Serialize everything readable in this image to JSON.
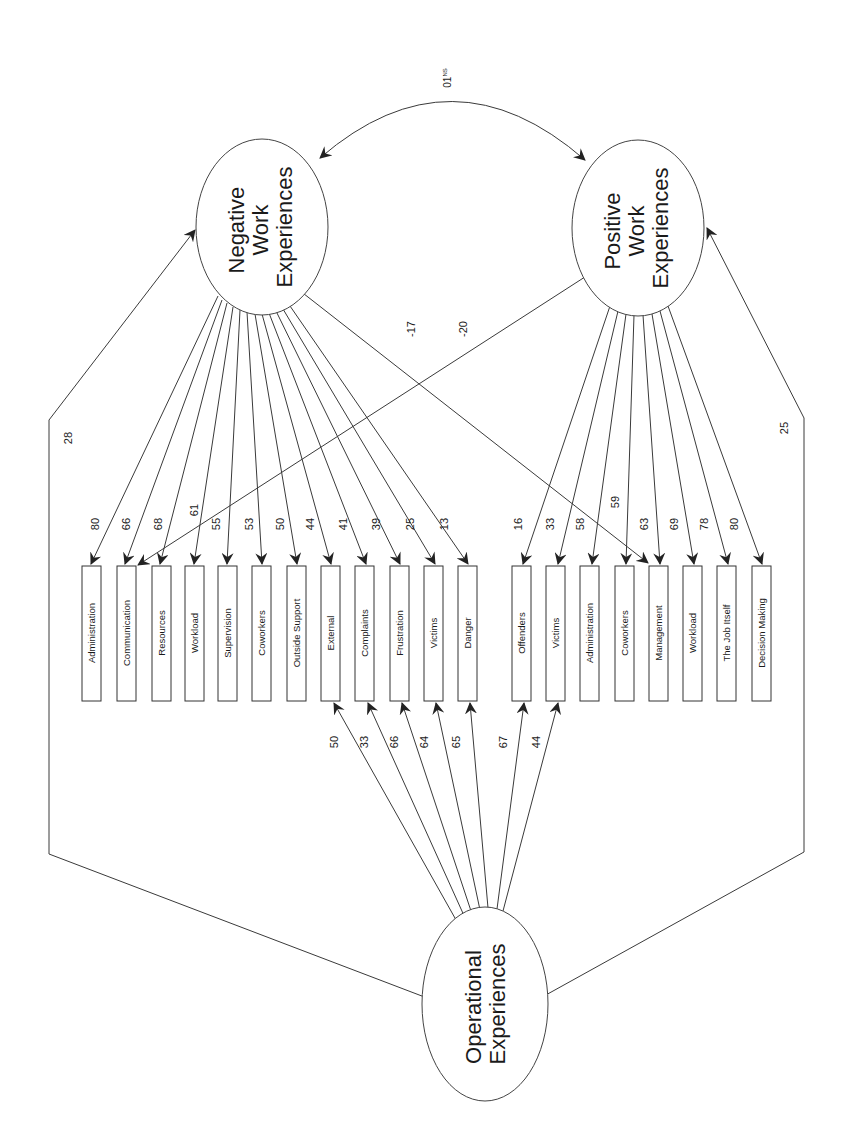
{
  "diagram": {
    "orientation": "rotated-90-ccw",
    "latent_factors": {
      "negative": {
        "label_lines": [
          "Negative",
          "Work",
          "Experiences"
        ],
        "cx": 262,
        "cy": 227,
        "rx": 66,
        "ry": 88
      },
      "positive": {
        "label_lines": [
          "Positive",
          "Work",
          "Experiences"
        ],
        "cx": 638,
        "cy": 228,
        "rx": 66,
        "ry": 88
      },
      "operational": {
        "label_lines": [
          "Operational",
          "Experiences"
        ],
        "cx": 485,
        "cy": 1004,
        "rx": 63,
        "ry": 97
      }
    },
    "correlation_negative_positive": {
      "label": "01",
      "superscript": "NS"
    },
    "path_operational_negative": {
      "label": "28"
    },
    "path_operational_positive": {
      "label": "25"
    },
    "negative_indicators": [
      {
        "label": "Administration",
        "loading": "80",
        "x": 88
      },
      {
        "label": "Communication",
        "loading": "66",
        "x": 123
      },
      {
        "label": "Resources",
        "loading": "68",
        "x": 157
      },
      {
        "label": "Workload",
        "loading": "61",
        "x": 190
      },
      {
        "label": "Supervision",
        "loading": "55",
        "x": 223
      },
      {
        "label": "Coworkers",
        "loading": "53",
        "x": 257
      },
      {
        "label": "Outside Support",
        "loading": "50",
        "x": 292
      },
      {
        "label": "External",
        "loading": "44",
        "x": 326
      },
      {
        "label": "Complaints",
        "loading": "41",
        "x": 360
      },
      {
        "label": "Frustration",
        "loading": "39",
        "x": 395
      },
      {
        "label": "Victims",
        "loading": "25",
        "x": 429
      },
      {
        "label": "Danger",
        "loading": "13",
        "x": 464
      }
    ],
    "positive_indicators": [
      {
        "label": "Offenders",
        "loading": "16",
        "x": 517
      },
      {
        "label": "Victims",
        "loading": "33",
        "x": 551
      },
      {
        "label": "Administration",
        "loading": "58",
        "x": 585
      },
      {
        "label": "Coworkers",
        "loading": "63",
        "x": 620
      },
      {
        "label": "Management",
        "loading": "69",
        "x": 654
      },
      {
        "label": "Workload",
        "loading": "78",
        "x": 688
      },
      {
        "label": "The Job Itself",
        "loading": "80",
        "x": 722
      },
      {
        "label": "Decision Making",
        "loading": "",
        "x": 757
      }
    ],
    "positive_extra_labels": [
      {
        "label": "59",
        "note": "Coworkers loading placed above"
      }
    ],
    "cross_loadings": [
      {
        "from": "Negative Work Experiences",
        "to": "Management",
        "label": "-17"
      },
      {
        "from": "Positive Work Experiences",
        "to": "Communication",
        "label": "-20"
      }
    ],
    "operational_paths": [
      {
        "to": "External",
        "label": "50"
      },
      {
        "to": "Complaints",
        "label": "33"
      },
      {
        "to": "Frustration",
        "label": "66"
      },
      {
        "to": "Victims (negative)",
        "label": "64"
      },
      {
        "to": "Danger",
        "label": "65"
      },
      {
        "to": "Offenders",
        "label": "67"
      },
      {
        "to": "Victims (positive)",
        "label": "44"
      }
    ]
  },
  "labels": {
    "neg_l1": "Negative",
    "neg_l2": "Work",
    "neg_l3": "Experiences",
    "pos_l1": "Positive",
    "pos_l2": "Work",
    "pos_l3": "Experiences",
    "op_l1": "Operational",
    "op_l2": "Experiences",
    "corr": "01",
    "corr_sup": "NS",
    "p28": "28",
    "p25": "25",
    "m17": "-17",
    "m20": "-20",
    "n": [
      "Administration",
      "Communication",
      "Resources",
      "Workload",
      "Supervision",
      "Coworkers",
      "Outside Support",
      "External",
      "Complaints",
      "Frustration",
      "Victims",
      "Danger"
    ],
    "nl": [
      "80",
      "66",
      "68",
      "61",
      "55",
      "53",
      "50",
      "44",
      "41",
      "39",
      "25",
      "13"
    ],
    "p": [
      "Offenders",
      "Victims",
      "Administration",
      "Coworkers",
      "Management",
      "Workload",
      "The Job Itself",
      "Decision Making"
    ],
    "pl": [
      "16",
      "33",
      "58",
      "59",
      "63",
      "69",
      "78",
      "80"
    ],
    "o": [
      "50",
      "33",
      "66",
      "64",
      "65",
      "67",
      "44"
    ]
  }
}
